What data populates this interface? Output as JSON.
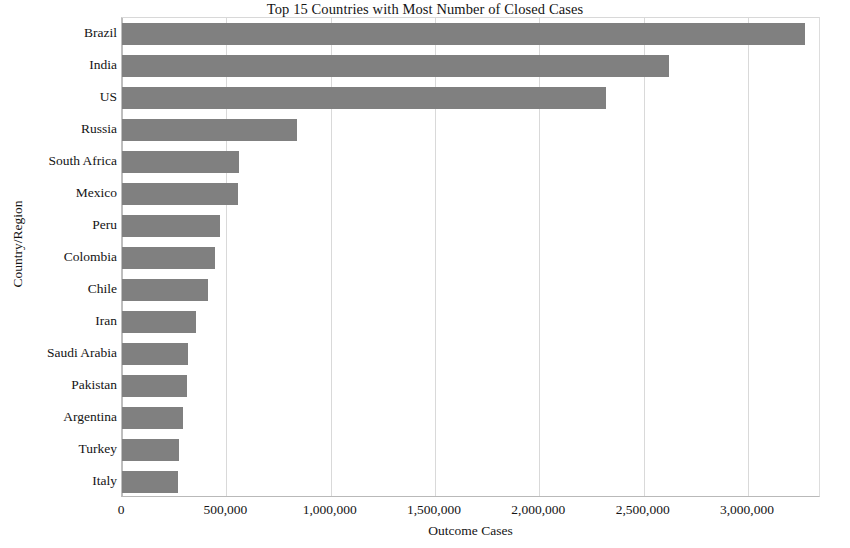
{
  "chart_data": {
    "type": "bar",
    "orientation": "horizontal",
    "title": "Top 15 Countries with Most Number of Closed Cases",
    "xlabel": "Outcome Cases",
    "ylabel": "Country/Region",
    "categories": [
      "Brazil",
      "India",
      "US",
      "Russia",
      "South Africa",
      "Mexico",
      "Peru",
      "Colombia",
      "Chile",
      "Iran",
      "Saudi Arabia",
      "Pakistan",
      "Argentina",
      "Turkey",
      "Italy"
    ],
    "values": [
      3273000,
      2622000,
      2321000,
      837000,
      560000,
      555000,
      469000,
      445000,
      412000,
      354000,
      316000,
      311000,
      292000,
      273000,
      268000
    ],
    "xlim": [
      0,
      3350000
    ],
    "xticks": [
      0,
      500000,
      1000000,
      1500000,
      2000000,
      2500000,
      3000000
    ],
    "xtick_labels": [
      "0",
      "500,000",
      "1,000,000",
      "1,500,000",
      "2,000,000",
      "2,500,000",
      "3,000,000"
    ],
    "grid": true,
    "grid_axis": "x",
    "legend": false,
    "bar_color": "#808080",
    "background_color": "#ffffff",
    "gridline_color": "#d9d9d9"
  }
}
